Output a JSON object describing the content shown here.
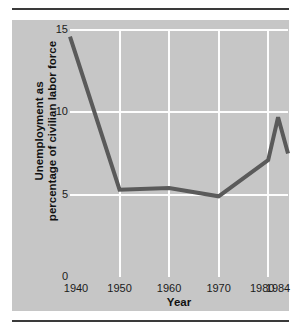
{
  "figure": {
    "panel_color": "#c6c6c6",
    "page_color": "#ffffff",
    "rule_color": "#3a3a3a",
    "grid_color": "#fdfdfd",
    "line_color": "#5a5a5a"
  },
  "chart_data": {
    "type": "line",
    "title": "",
    "subtitle": "",
    "xlabel": "Year",
    "ylabel": "Unemployment as percentage of civilian labor force",
    "ylabel_line1": "Unemployment as",
    "ylabel_line2": "percentage of civilian labor force",
    "xlim": [
      1940,
      1984
    ],
    "ylim": [
      0,
      15
    ],
    "yticks": [
      0,
      5,
      10,
      15
    ],
    "ytick_labels": [
      "0",
      "5",
      "10",
      "15"
    ],
    "xticks": [
      1940,
      1950,
      1960,
      1970,
      1980,
      1984
    ],
    "xtick_labels": [
      "1940",
      "1950",
      "1960",
      "1970",
      "1980",
      "1984"
    ],
    "grid": {
      "vertical_at": [
        1950,
        1960,
        1970,
        1980
      ],
      "horizontal_at": [
        5,
        10,
        15
      ],
      "color": "#fdfdfd"
    },
    "legend": null,
    "legend_position": "none",
    "series": [
      {
        "name": "Unemployment rate",
        "color": "#5a5a5a",
        "line_width": 4,
        "x": [
          1940,
          1950,
          1960,
          1970,
          1980,
          1982,
          1984
        ],
        "values": [
          14.6,
          5.3,
          5.4,
          4.9,
          7.1,
          9.7,
          7.5
        ]
      }
    ],
    "annotations": []
  }
}
